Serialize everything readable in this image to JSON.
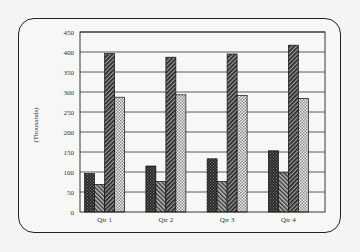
{
  "chart_data": {
    "type": "bar",
    "title": "",
    "xlabel": "",
    "ylabel": "(Thousands)",
    "ylim": [
      0,
      450
    ],
    "yticks": [
      0,
      50,
      100,
      150,
      200,
      250,
      300,
      350,
      400,
      450
    ],
    "grid": true,
    "legend": "none",
    "categories": [
      "Qtr 1",
      "Qtr 2",
      "Qtr 3",
      "Qtr 4"
    ],
    "series": [
      {
        "name": "Series 1",
        "pattern": "dark-crosshatch",
        "values": [
          96,
          115,
          133,
          153
        ]
      },
      {
        "name": "Series 2",
        "pattern": "medium-diagonal",
        "values": [
          69,
          76,
          76,
          98
        ]
      },
      {
        "name": "Series 3",
        "pattern": "dark-hatch",
        "values": [
          396,
          387,
          395,
          417
        ]
      },
      {
        "name": "Series 4",
        "pattern": "light-checker",
        "values": [
          287,
          293,
          291,
          284
        ]
      }
    ]
  },
  "colors": {
    "axis": "#222222",
    "grid": "#333333",
    "background": "#f7f7f5"
  }
}
